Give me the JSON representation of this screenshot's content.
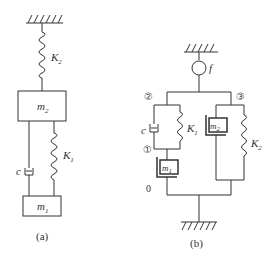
{
  "diagram_a": {
    "caption": "(a)",
    "spring_top": {
      "label": "K",
      "sub": "2"
    },
    "mass_top": {
      "label": "m",
      "sub": "2"
    },
    "damper": {
      "label": "c"
    },
    "spring_bottom": {
      "label": "K",
      "sub": "1"
    },
    "mass_bottom": {
      "label": "m",
      "sub": "1"
    }
  },
  "diagram_b": {
    "caption": "(b)",
    "force_node": {
      "label": "f"
    },
    "node_1": "①",
    "node_2": "②",
    "node_3": "③",
    "node_0": "0",
    "damper": {
      "label": "c"
    },
    "spring_1": {
      "label": "K",
      "sub": "1"
    },
    "spring_2": {
      "label": "K",
      "sub": "2"
    },
    "mass_1": {
      "label": "m",
      "sub": "1"
    },
    "mass_2": {
      "label": "m",
      "sub": "2"
    }
  }
}
